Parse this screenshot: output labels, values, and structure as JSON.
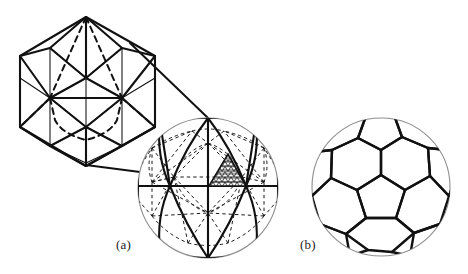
{
  "figure": {
    "kind": "line-drawing",
    "background_color": "#ffffff",
    "ink_color": "#111111",
    "panels": [
      {
        "id": "a",
        "caption": "(a)",
        "caption_x": 116,
        "caption_y": 237,
        "description": "Icosahedron with subdivided triangular faces, blown up from a sphere",
        "parts": [
          {
            "name": "icosahedron-wireframe",
            "shape": "icosahedron",
            "subdivision_frequency": 2,
            "center_x": 88,
            "center_y": 90,
            "radius": 72,
            "hidden_edges_style": "dashed"
          },
          {
            "name": "callout-lines",
            "count": 2,
            "style": "solid",
            "from": "icosahedron face",
            "to": "sphere highlighted face"
          },
          {
            "name": "geodesic-sphere",
            "shape": "sphere",
            "center_x": 208,
            "center_y": 188,
            "radius": 70,
            "solid_net": "icosahedral great-circle arcs",
            "dashed_net": "dual pentagonal/dodecahedral arcs",
            "shaded_face": {
              "label": "subdivided-triangle",
              "rows": 7,
              "fill": "triangular-mesh-hatch"
            }
          }
        ]
      },
      {
        "id": "b",
        "caption": "(b)",
        "caption_x": 300,
        "caption_y": 237,
        "description": "Truncated icosahedron (soccer ball) on a sphere",
        "parts": [
          {
            "name": "truncated-icosahedron-sphere",
            "shape": "sphere",
            "center_x": 381,
            "center_y": 187,
            "radius": 69,
            "faces": {
              "pentagons": 12,
              "hexagons": 20,
              "total": 32
            }
          }
        ]
      }
    ]
  },
  "colors": {
    "ink": "#111111",
    "paper": "#ffffff",
    "outline_gray": "#8a8a8a",
    "hatch": "#2b2b2b"
  },
  "captions": {
    "a": "(a)",
    "b": "(b)"
  }
}
